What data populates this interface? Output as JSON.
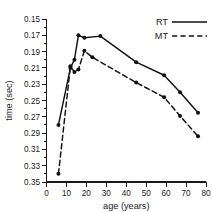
{
  "chart_data": {
    "type": "line",
    "title": "",
    "xlabel": "age (years)",
    "ylabel": "time (sec)",
    "xlim": [
      0,
      80
    ],
    "ylim": [
      0.15,
      0.35
    ],
    "y_inverted": true,
    "grid": false,
    "legend_position": "top-right",
    "x_ticks": [
      0,
      10,
      20,
      30,
      40,
      50,
      60,
      70,
      80
    ],
    "x_tick_labels": [
      "0",
      "10",
      "20",
      "30",
      "40",
      "50",
      "60",
      "70",
      "80"
    ],
    "y_ticks": [
      0.15,
      0.17,
      0.19,
      0.21,
      0.23,
      0.25,
      0.27,
      0.29,
      0.31,
      0.33,
      0.35
    ],
    "y_tick_labels": [
      "0.15",
      "0.17",
      "0.19",
      "0.21",
      "0.23",
      "0.25",
      "0.27",
      "0.29",
      "0.31",
      "0.33",
      "0.35"
    ],
    "y_minor_ticks": [
      0.16,
      0.18,
      0.2,
      0.22,
      0.24,
      0.26,
      0.28,
      0.3,
      0.32,
      0.34
    ],
    "series": [
      {
        "name": "RT",
        "style": "solid",
        "color": "#111111",
        "marker": "filled-circle",
        "x": [
          6,
          12,
          14,
          16,
          19,
          27,
          45,
          59,
          67,
          76
        ],
        "y": [
          0.28,
          0.21,
          0.2,
          0.17,
          0.173,
          0.171,
          0.203,
          0.219,
          0.24,
          0.265
        ]
      },
      {
        "name": "MT",
        "style": "dashed",
        "color": "#111111",
        "marker": "filled-circle",
        "x": [
          6,
          12,
          14,
          16,
          19,
          23,
          45,
          59,
          67,
          76
        ],
        "y": [
          0.34,
          0.208,
          0.215,
          0.212,
          0.189,
          0.197,
          0.228,
          0.246,
          0.269,
          0.294
        ]
      }
    ]
  },
  "legend": {
    "entries": [
      {
        "label": "RT",
        "style": "solid"
      },
      {
        "label": "MT",
        "style": "dashed"
      }
    ]
  }
}
